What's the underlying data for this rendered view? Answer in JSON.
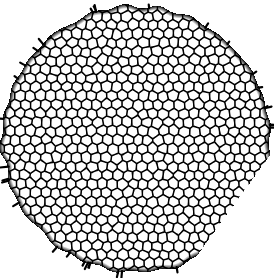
{
  "figure": {
    "title": "Cellular honeycomb disc micrograph",
    "caption": "",
    "width": 274,
    "height": 278,
    "background_color": "#ffffff"
  },
  "chart_data": {
    "type": "heatmap",
    "title": "Cellular honeycomb disc micrograph",
    "xlabel": "",
    "ylabel": "",
    "description": "Binary (black and white) image of a near-circular disc packed with a dense foam-like cellular mosaic; white polygonal cells separated by thick black walls.",
    "grid": false,
    "legend": false,
    "xlim": [
      0,
      274
    ],
    "ylim": [
      0,
      278
    ],
    "disc": {
      "center_x": 136,
      "center_y": 139,
      "radius_x": 134,
      "radius_y": 133,
      "boundary_roughness": 3.2,
      "flat_cut": {
        "enabled": true,
        "angle_deg": 36,
        "offset": 118
      }
    },
    "cells": {
      "approximate_count": 560,
      "mean_pitch_px": 10.2,
      "pitch_min_px": 9.0,
      "pitch_max_px": 11.4,
      "jitter": 0.3,
      "wall_thickness_px": 2.4,
      "cell_fill_color": "#ffffff",
      "wall_color": "#000000",
      "shape": "irregular-polygon",
      "sides_typical": 6
    },
    "edge_spurs": {
      "enabled": true,
      "count": 34,
      "length_px_min": 3,
      "length_px_max": 8,
      "thickness_px": 2.2,
      "color": "#000000"
    },
    "colors": {
      "foreground": "#000000",
      "background": "#ffffff",
      "cell_interior": "#fefefe"
    },
    "random_seed": 20240517
  }
}
